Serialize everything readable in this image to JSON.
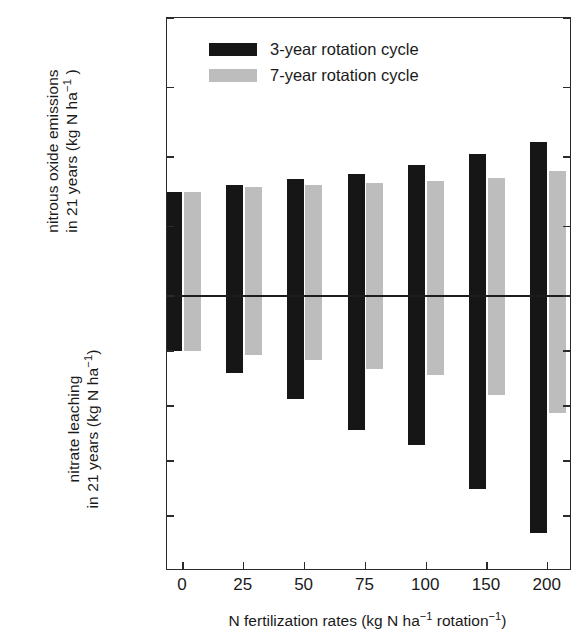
{
  "chart_data": {
    "type": "bar",
    "title": "",
    "subtitle": "",
    "orientation": "vertical",
    "grid": false,
    "categories": [
      "0",
      "25",
      "50",
      "75",
      "100",
      "150",
      "200"
    ],
    "xlabel": "N fertilization rates (kg N ha−1 rotation−1)",
    "xlabel_parts": {
      "pre": "N fertilization rates (kg N ha",
      "sup1": "−1",
      "mid": " rotation",
      "sup2": "−1",
      "post": ")"
    },
    "ylabel_top": "nitrous oxide emissions in 21 years (kg N ha−1 )",
    "ylabel_top_lines": [
      {
        "pre": "nitrous oxide emissions",
        "sup": "",
        "post": ""
      },
      {
        "pre": "in 21 years (kg N ha",
        "sup": "−1",
        "post": " )"
      }
    ],
    "ylabel_bottom": "nitrate leaching in 21 years (kg N ha−1)",
    "ylabel_bottom_lines": [
      {
        "pre": "nitrate leaching",
        "sup": "",
        "post": ""
      },
      {
        "pre": "in 21 years (kg N ha",
        "sup": "−1",
        "post": ")"
      }
    ],
    "ylim": [
      -1500,
      40
    ],
    "yticks": [
      40,
      30,
      20,
      10,
      0,
      -300,
      -600,
      -900,
      -1200,
      -1500
    ],
    "ytick_labels": [
      "40",
      "30",
      "20",
      "10",
      "0",
      "-300",
      "-600",
      "-900",
      "-1200",
      "-1500"
    ],
    "y_axis_note": "broken/dual scale: above 0 emissions in kg N ha-1 (0 to 40); below 0 nitrate leaching in kg N ha-1 (0 to -1500)",
    "legend_position": "upper left",
    "series": [
      {
        "name": "3-year rotation cycle",
        "color": "#161616",
        "emissions": [
          15.0,
          16.0,
          16.8,
          17.6,
          18.8,
          20.5,
          22.2
        ],
        "leaching": [
          -300,
          -420,
          -560,
          -730,
          -810,
          -1050,
          -1290
        ]
      },
      {
        "name": "7-year rotation cycle",
        "color": "#bdbdbd",
        "emissions": [
          15.0,
          15.7,
          16.0,
          16.2,
          16.5,
          17.0,
          18.0
        ],
        "leaching": [
          -300,
          -320,
          -350,
          -400,
          -430,
          -540,
          -640
        ]
      }
    ]
  },
  "legend": {
    "items": [
      {
        "label": "3-year rotation cycle",
        "color": "#161616"
      },
      {
        "label": "7-year rotation cycle",
        "color": "#bdbdbd"
      }
    ]
  }
}
